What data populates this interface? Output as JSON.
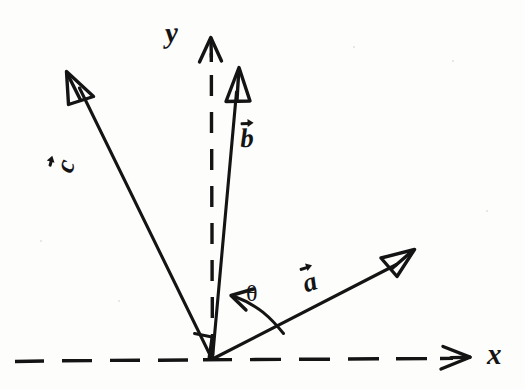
{
  "figure": {
    "kind": "hand-drawn-vector-diagram",
    "background_color": "#fdfdfc",
    "ink_color": "#141414",
    "width": 525,
    "height": 389
  },
  "axes": {
    "origin": {
      "x": 212,
      "y": 360
    },
    "x_axis": {
      "label": "x",
      "style": "dashed",
      "label_x": 487,
      "label_y": 341,
      "start_x": 14,
      "end_x": 452,
      "y": 360,
      "arrow_tip_x": 468
    },
    "y_axis": {
      "label": "y",
      "style": "dashed",
      "label_x": 166,
      "label_y": 20,
      "x": 212,
      "start_y": 358,
      "end_y": 60,
      "arrow_tip_y": 36
    }
  },
  "vectors": [
    {
      "name": "c",
      "label": "c",
      "has_overarrow": true,
      "tip": {
        "x": 70,
        "y": 78
      },
      "label_pos": {
        "x": 62,
        "y": 152
      },
      "label_rotation": -72,
      "arrowhead": "open-triangle"
    },
    {
      "name": "b",
      "label": "b",
      "has_overarrow": true,
      "tip": {
        "x": 240,
        "y": 73
      },
      "label_pos": {
        "x": 240,
        "y": 120
      },
      "label_rotation": 0,
      "arrowhead": "open-triangle"
    },
    {
      "name": "a",
      "label": "a",
      "has_overarrow": true,
      "tip": {
        "x": 412,
        "y": 252
      },
      "label_pos": {
        "x": 303,
        "y": 266
      },
      "label_rotation": -16,
      "arrowhead": "open-triangle"
    }
  ],
  "annotations": {
    "angle": {
      "symbol": "θ",
      "label_pos": {
        "x": 246,
        "y": 283
      },
      "between": [
        "a",
        "b"
      ],
      "arc_arrow_points_to": "b"
    },
    "right_angle": {
      "present": true,
      "between": [
        "c",
        "x"
      ],
      "pos": {
        "x": 196,
        "y": 332
      }
    }
  }
}
